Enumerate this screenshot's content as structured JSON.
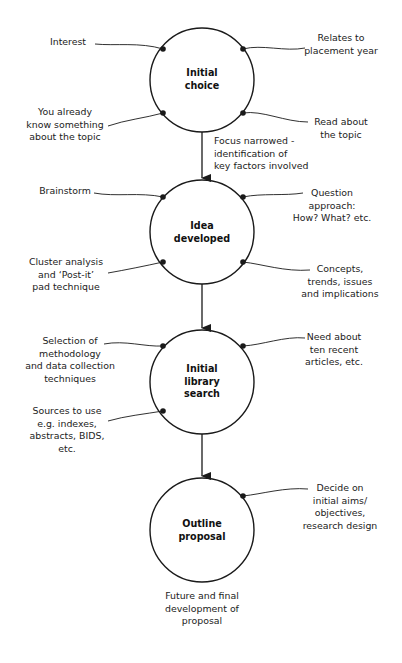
{
  "diagram": {
    "type": "flow",
    "nodes": [
      {
        "id": "n1",
        "title": [
          "Initial",
          "choice"
        ],
        "inputs": {
          "top_left": [
            "Interest"
          ],
          "top_right": [
            "Relates to",
            "placement year"
          ],
          "bottom_left": [
            "You already",
            "know something",
            "about the topic"
          ],
          "bottom_right": [
            "Read about",
            "the topic"
          ]
        }
      },
      {
        "id": "n2",
        "title": [
          "Idea",
          "developed"
        ],
        "inputs": {
          "top_left": [
            "Brainstorm"
          ],
          "top_right": [
            "Question",
            "approach:",
            "How? What? etc."
          ],
          "bottom_left": [
            "Cluster analysis",
            "and ‘Post-it’",
            "pad technique"
          ],
          "bottom_right": [
            "Concepts,",
            "trends, issues",
            "and implications"
          ]
        }
      },
      {
        "id": "n3",
        "title": [
          "Initial",
          "library",
          "search"
        ],
        "inputs": {
          "top_left": [
            "Selection of",
            "methodology",
            "and data collection",
            "techniques"
          ],
          "top_right": [
            "Need about",
            "ten recent",
            "articles, etc."
          ],
          "bottom_left": [
            "Sources to use",
            "e.g. indexes,",
            "abstracts, BIDS,",
            "etc."
          ]
        }
      },
      {
        "id": "n4",
        "title": [
          "Outline",
          "proposal"
        ],
        "inputs": {
          "top_right": [
            "Decide on",
            "initial aims/",
            "objectives,",
            "research design"
          ]
        }
      }
    ],
    "edges": [
      {
        "from": "n1",
        "to": "n2",
        "label": [
          "Focus narrowed -",
          "identification of",
          "key factors involved"
        ]
      },
      {
        "from": "n2",
        "to": "n3",
        "label": []
      },
      {
        "from": "n3",
        "to": "n4",
        "label": []
      }
    ],
    "footer_note": [
      "Future and final",
      "development of",
      "proposal"
    ],
    "colors": {
      "stroke": "#1a1a1a",
      "text": "#222222",
      "background": "#ffffff"
    }
  }
}
